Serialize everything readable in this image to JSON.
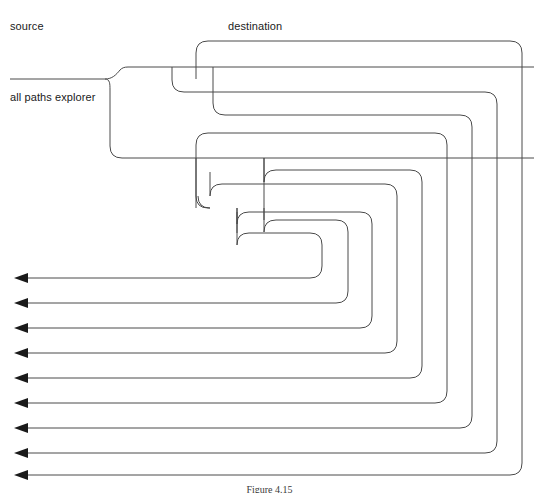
{
  "figure": {
    "caption": "Figure 4.15",
    "title": "all paths explorer",
    "type": "flow-diagram"
  },
  "labels": {
    "source": "source",
    "destination": "destination",
    "explorer": "all paths explorer"
  },
  "colors": {
    "stroke": "#4a4a4a",
    "arrow": "#1a1a1a",
    "background": "#ffffff",
    "text": "#1a1a1a"
  },
  "geometry": {
    "canvas": {
      "width": 539,
      "height": 493
    },
    "arrow_tip_x": 14,
    "arrow_rows_y": [
      278,
      303,
      328,
      353,
      378,
      403,
      428,
      453,
      475
    ],
    "arrow_count": 9,
    "right_rail_x": [
      322,
      348,
      372,
      397,
      422,
      447,
      472,
      497,
      522
    ],
    "corner_radius": 12,
    "source_line_y": 79,
    "source_line_x_start": 10,
    "branch_x": 110
  },
  "paths": [
    {
      "id": "p1",
      "label": "path-outermost"
    },
    {
      "id": "p2",
      "label": "path-2"
    },
    {
      "id": "p3",
      "label": "path-3"
    },
    {
      "id": "p4",
      "label": "path-4"
    },
    {
      "id": "p5",
      "label": "path-5"
    },
    {
      "id": "p6",
      "label": "path-6"
    },
    {
      "id": "p7",
      "label": "path-7"
    },
    {
      "id": "p8",
      "label": "path-8"
    },
    {
      "id": "p9",
      "label": "path-innermost"
    }
  ]
}
